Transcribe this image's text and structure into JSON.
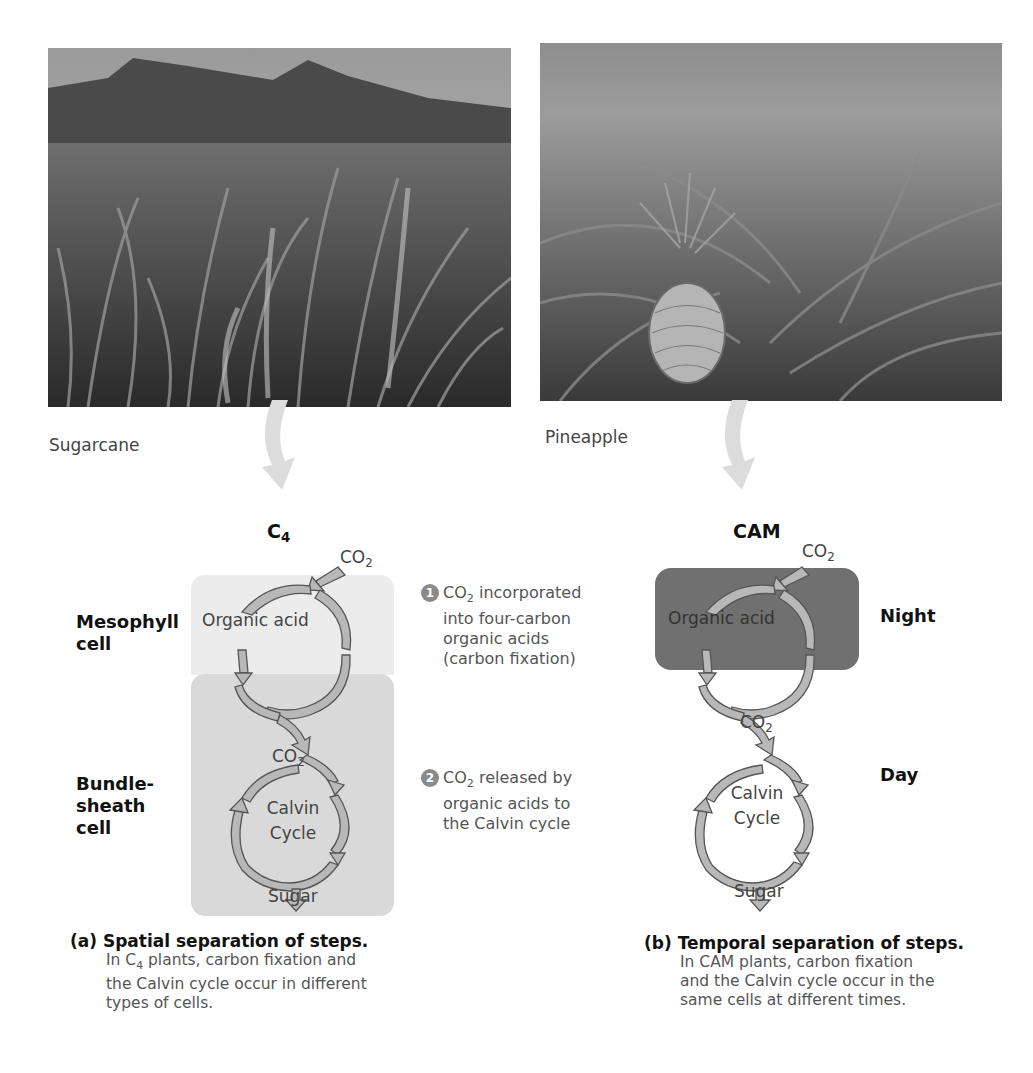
{
  "photos": {
    "left": {
      "label": "Sugarcane",
      "subject": "sugarcane field photo"
    },
    "right": {
      "label": "Pineapple",
      "subject": "pineapple field photo"
    }
  },
  "c4": {
    "title": "C",
    "title_sub": "4",
    "co2_in": "CO",
    "co2_in_sub": "2",
    "organic_acid": "Organic acid",
    "co2_mid": "CO",
    "co2_mid_sub": "2",
    "calvin_line1": "Calvin",
    "calvin_line2": "Cycle",
    "sugar": "Sugar",
    "mesophyll_line1": "Mesophyll",
    "mesophyll_line2": "cell",
    "bundle_line1": "Bundle-",
    "bundle_line2": "sheath",
    "bundle_line3": "cell",
    "mesophyll_color": "#ececec",
    "bundle_color": "#d9d9d9"
  },
  "steps": [
    {
      "number": "1",
      "prefix": "CO",
      "prefix_sub": "2",
      "line1_rest": " incorporated",
      "line2": "into four-carbon",
      "line3": "organic acids",
      "line4": "(carbon fixation)"
    },
    {
      "number": "2",
      "prefix": "CO",
      "prefix_sub": "2",
      "line1_rest": " released by",
      "line2": "organic acids to",
      "line3": "the Calvin cycle"
    }
  ],
  "cam": {
    "title": "CAM",
    "co2_in": "CO",
    "co2_in_sub": "2",
    "organic_acid": "Organic acid",
    "co2_mid": "CO",
    "co2_mid_sub": "2",
    "calvin_line1": "Calvin",
    "calvin_line2": "Cycle",
    "sugar": "Sugar",
    "night": "Night",
    "day": "Day",
    "night_color": "#707070"
  },
  "footnotes": {
    "a": {
      "head": "(a) Spatial separation of steps.",
      "body_pre": "In C",
      "body_sub": "4",
      "body_post": " plants, carbon fixation and",
      "line2": "the Calvin cycle occur in different",
      "line3": "types of cells."
    },
    "b": {
      "head": "(b) Temporal separation of steps.",
      "line1": "In CAM plants, carbon fixation",
      "line2": "and the Calvin cycle occur in the",
      "line3": "same cells at different times."
    }
  },
  "colors": {
    "arrow_fill": "#b8b8b8",
    "arrow_stroke": "#555555",
    "big_arrow": "#dcdcdc"
  }
}
